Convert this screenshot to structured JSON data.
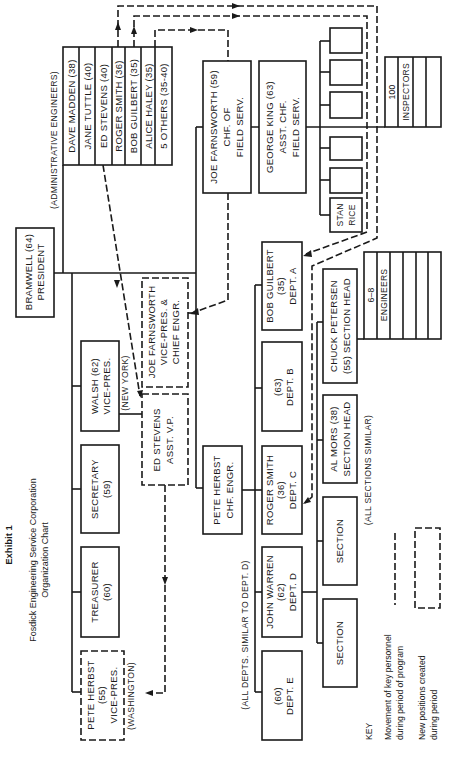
{
  "header": {
    "exhibit": "Exhibit 1",
    "title_line1": "Fosdick Engineering Service Corporation",
    "title_line2": "Organization Chart"
  },
  "president": {
    "line1": "BRAMWELL (64)",
    "line2": "PRESIDENT"
  },
  "admin_engineers": {
    "label": "(ADMINISTRATIVE ENGINEERS)",
    "members": [
      "DAVE MADDEN (38)",
      "JANE TUTTLE (40)",
      "ED STEVENS (40)",
      "ROGER SMITH (36)",
      "BOB GUILBERT (35)",
      "ALICE HALEY (35)",
      "5 OTHERS (35-40)"
    ]
  },
  "vice_presidents": {
    "walsh": {
      "line1": "WALSH (62)",
      "line2": "VICE-PRES.",
      "location": "(NEW YORK)"
    },
    "secretary": {
      "line1": "SECRETARY",
      "line2": "(59)"
    },
    "treasurer": {
      "line1": "TREASURER",
      "line2": "(60)"
    },
    "herbst_vp": {
      "line1": "PETE HERBST",
      "line2": "(55)",
      "line3": "VICE-PRES.",
      "location": "(WASHINGTON)"
    },
    "farnsworth_vp": {
      "line1": "JOE FARNSWORTH",
      "line2": "VICE-PRES. &",
      "line3": "CHIEF ENGR."
    },
    "stevens_avp": {
      "line1": "ED STEVENS",
      "line2": "ASST. V.P."
    }
  },
  "field_service": {
    "chief": {
      "line1": "JOE FARNSWORTH (59)",
      "line2": "CHF. OF",
      "line3": "FIELD SERV."
    },
    "assistant": {
      "line1": "GEORGE KING (63)",
      "line2": "ASST. CHF.",
      "line3": "FIELD SERV."
    },
    "stan_rice": {
      "line1": "STAN",
      "line2": "RICE"
    },
    "inspectors": {
      "line1": "100",
      "line2": "INSPECTORS"
    }
  },
  "engineering": {
    "chief": {
      "line1": "PETE HERBST",
      "line2": "CHF. ENGR."
    },
    "departments": [
      {
        "line1": "BOB GUILBERT",
        "line2": "(35)",
        "line3": "DEPT. A"
      },
      {
        "line1": "(63)",
        "line2": "DEPT. B"
      },
      {
        "line1": "ROGER SMITH",
        "line2": "(36)",
        "line3": "DEPT. C"
      },
      {
        "line1": "JOHN WARREN",
        "line2": "(62)",
        "line3": "DEPT. D"
      },
      {
        "line1": "(60)",
        "line2": "DEPT. E"
      }
    ],
    "departments_note": "(ALL DEPTS. SIMILAR TO DEPT. D)",
    "sections": [
      {
        "line1": "CHUCK PETERSEN",
        "line2": "(55)  SECTION HEAD"
      },
      {
        "line1": "AL MORS (38)",
        "line2": "SECTION HEAD"
      },
      {
        "line1": "SECTION"
      },
      {
        "line1": "SECTION"
      }
    ],
    "sections_note": "(ALL SECTIONS SIMILAR)",
    "engineers": {
      "line1": "6–8",
      "line2": "ENGINEERS"
    }
  },
  "key": {
    "title": "KEY",
    "movement_line1": "Movement of key personnel",
    "movement_line2": "during period of program",
    "new_line1": "New positions created",
    "new_line2": "during period"
  }
}
